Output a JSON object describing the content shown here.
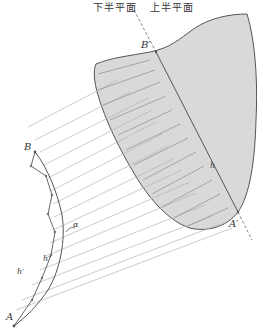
{
  "diagram": {
    "plane_labels": {
      "lower_half": "下半平面",
      "upper_half": "上半平面"
    },
    "points": {
      "A": "A",
      "B": "B",
      "A_prime": "A′",
      "B_prime": "B′"
    },
    "curve_labels": {
      "h_prime": "h′",
      "h_double_prime": "h″",
      "h": "h",
      "angle": "α"
    },
    "colors": {
      "stroke": "#555555",
      "hatch": "#9a9a9a",
      "projection_line": "#b5b5b5",
      "shaded_fill": "#d9d9d9",
      "dashed_axis": "#666666",
      "background": "#ffffff"
    }
  }
}
